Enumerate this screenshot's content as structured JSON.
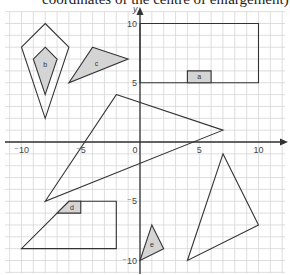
{
  "header": {
    "text": "coordinates of the centre of enlargement)"
  },
  "grid": {
    "origin_px": [
      140,
      142
    ],
    "unit_px": 11.85,
    "x_range": [
      -11,
      12
    ],
    "y_range": [
      -11,
      11
    ],
    "grid_color": "#d6d6d6",
    "axis_color": "#333333",
    "shape_stroke": "#333333",
    "shade_fill": "#d4d4d4"
  },
  "axes": {
    "x_ticks": [
      {
        "value": -10,
        "label": "⁻10"
      },
      {
        "value": -5,
        "label": "⁻5"
      },
      {
        "value": 0,
        "label": "0"
      },
      {
        "value": 5,
        "label": "5"
      },
      {
        "value": 10,
        "label": "10"
      }
    ],
    "y_ticks": [
      {
        "value": 10,
        "label": "10"
      },
      {
        "value": 5,
        "label": "5"
      },
      {
        "value": -5,
        "label": "⁻5"
      },
      {
        "value": -10,
        "label": "⁻10"
      }
    ],
    "y_label": "y"
  },
  "shapes": [
    {
      "name": "large-rectangle",
      "label": "",
      "filled": false,
      "points": [
        [
          0,
          10
        ],
        [
          10,
          10
        ],
        [
          10,
          5
        ],
        [
          0,
          5
        ]
      ]
    },
    {
      "name": "rectangle-a",
      "label": "a",
      "filled": true,
      "points": [
        [
          4,
          6
        ],
        [
          6,
          6
        ],
        [
          6,
          5
        ],
        [
          4,
          5
        ]
      ]
    },
    {
      "name": "outer-kite",
      "label": "",
      "filled": false,
      "points": [
        [
          -8,
          10
        ],
        [
          -6,
          8
        ],
        [
          -8,
          2
        ],
        [
          -10,
          8
        ]
      ]
    },
    {
      "name": "kite-b",
      "label": "b",
      "filled": true,
      "points": [
        [
          -8,
          8
        ],
        [
          -7,
          7
        ],
        [
          -8,
          4
        ],
        [
          -9,
          7
        ]
      ]
    },
    {
      "name": "triangle-c",
      "label": "c",
      "filled": true,
      "points": [
        [
          -4,
          8
        ],
        [
          -1,
          7
        ],
        [
          -6,
          5
        ]
      ]
    },
    {
      "name": "large-triangle",
      "label": "",
      "filled": false,
      "points": [
        [
          -2,
          4
        ],
        [
          7,
          1
        ],
        [
          -8,
          -5
        ]
      ]
    },
    {
      "name": "large-trapezium",
      "label": "",
      "filled": false,
      "points": [
        [
          -6,
          -5
        ],
        [
          -2,
          -5
        ],
        [
          -2,
          -9
        ],
        [
          -10,
          -9
        ]
      ]
    },
    {
      "name": "trapezium-d",
      "label": "d",
      "filled": true,
      "points": [
        [
          -6,
          -5
        ],
        [
          -5,
          -5
        ],
        [
          -5,
          -6
        ],
        [
          -7,
          -6
        ]
      ]
    },
    {
      "name": "right-triangle",
      "label": "",
      "filled": false,
      "points": [
        [
          7,
          -1
        ],
        [
          10,
          -7
        ],
        [
          4,
          -10
        ]
      ]
    },
    {
      "name": "triangle-e",
      "label": "e",
      "filled": true,
      "points": [
        [
          1,
          -7
        ],
        [
          2,
          -9
        ],
        [
          0,
          -10
        ]
      ]
    }
  ]
}
